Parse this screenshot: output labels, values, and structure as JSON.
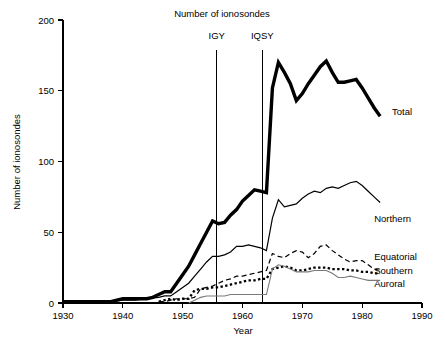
{
  "chart_data": {
    "type": "line",
    "title": "Number of ionosondes",
    "xlabel": "Year",
    "ylabel": "Number of ionosondes",
    "xlim": [
      1930,
      1990
    ],
    "ylim": [
      0,
      200
    ],
    "xticks": [
      1930,
      1940,
      1950,
      1960,
      1970,
      1980,
      1990
    ],
    "xtick_labels": [
      "1930",
      "1940",
      "1950",
      "1960",
      "1970",
      "1980",
      "1990"
    ],
    "yticks": [
      0,
      50,
      100,
      150,
      200
    ],
    "ytick_labels": [
      "0",
      "50",
      "100",
      "150",
      "200"
    ],
    "grid": false,
    "legend_position": "right-inline",
    "annotations": [
      {
        "label": "IGY",
        "x": 1955.7,
        "label_y": 185
      },
      {
        "label": "IQSY",
        "x": 1963.3,
        "label_y": 185
      }
    ],
    "series": [
      {
        "name": "Total",
        "style": "thick-solid",
        "color": "#000000",
        "label_x": 1984.5,
        "label_y": 135,
        "x": [
          1930,
          1932,
          1934,
          1936,
          1938,
          1939,
          1940,
          1941,
          1942,
          1943,
          1944,
          1945,
          1946,
          1947,
          1948,
          1949,
          1950,
          1951,
          1952,
          1953,
          1954,
          1955,
          1956,
          1957,
          1958,
          1959,
          1960,
          1961,
          1962,
          1963,
          1964,
          1965,
          1966,
          1967,
          1968,
          1969,
          1970,
          1971,
          1972,
          1973,
          1974,
          1975,
          1976,
          1977,
          1978,
          1979,
          1980,
          1981,
          1982,
          1983
        ],
        "values": [
          1,
          1,
          1,
          1,
          1,
          2,
          3,
          3,
          3,
          3,
          3,
          4,
          6,
          8,
          8,
          14,
          20,
          26,
          34,
          42,
          50,
          58,
          56,
          57,
          62,
          66,
          72,
          76,
          80,
          79,
          78,
          152,
          170,
          163,
          155,
          143,
          148,
          155,
          161,
          167,
          171,
          163,
          156,
          156,
          157,
          158,
          152,
          145,
          138,
          132
        ]
      },
      {
        "name": "Northern",
        "style": "thin-solid",
        "color": "#000000",
        "label_x": 1981.5,
        "label_y": 60,
        "x": [
          1930,
          1935,
          1938,
          1940,
          1942,
          1944,
          1946,
          1947,
          1948,
          1949,
          1950,
          1951,
          1952,
          1953,
          1954,
          1955,
          1956,
          1957,
          1958,
          1959,
          1960,
          1961,
          1962,
          1963,
          1964,
          1965,
          1966,
          1967,
          1968,
          1969,
          1970,
          1971,
          1972,
          1973,
          1974,
          1975,
          1976,
          1977,
          1978,
          1979,
          1980,
          1981,
          1982,
          1983
        ],
        "values": [
          1,
          1,
          1,
          2,
          2,
          3,
          4,
          5,
          5,
          8,
          11,
          14,
          19,
          24,
          29,
          33,
          33,
          34,
          36,
          40,
          40,
          41,
          40,
          39,
          37,
          60,
          73,
          68,
          69,
          70,
          74,
          77,
          79,
          78,
          81,
          82,
          81,
          83,
          85,
          86,
          83,
          79,
          75,
          71
        ]
      },
      {
        "name": "Equatorial",
        "style": "dashed",
        "color": "#000000",
        "label_x": 1981.5,
        "label_y": 33,
        "x": [
          1946,
          1947,
          1948,
          1949,
          1950,
          1951,
          1952,
          1953,
          1954,
          1955,
          1956,
          1957,
          1958,
          1959,
          1960,
          1961,
          1962,
          1963,
          1964,
          1965,
          1966,
          1967,
          1968,
          1969,
          1970,
          1971,
          1972,
          1973,
          1974,
          1975,
          1976,
          1977,
          1978,
          1979,
          1980,
          1981,
          1982,
          1983
        ],
        "values": [
          1,
          1,
          2,
          3,
          3,
          3,
          4,
          10,
          11,
          12,
          14,
          16,
          17,
          19,
          19,
          20,
          21,
          22,
          23,
          35,
          33,
          32,
          35,
          37,
          36,
          32,
          35,
          40,
          41,
          37,
          34,
          31,
          29,
          30,
          30,
          27,
          24,
          23
        ]
      },
      {
        "name": "Southern",
        "style": "thick-dotted",
        "color": "#000000",
        "label_x": 1981.5,
        "label_y": 23,
        "x": [
          1946,
          1947,
          1948,
          1949,
          1950,
          1951,
          1952,
          1953,
          1954,
          1955,
          1956,
          1957,
          1958,
          1959,
          1960,
          1961,
          1962,
          1963,
          1964,
          1965,
          1966,
          1967,
          1968,
          1969,
          1970,
          1971,
          1972,
          1973,
          1974,
          1975,
          1976,
          1977,
          1978,
          1979,
          1980,
          1981,
          1982,
          1983
        ],
        "values": [
          1,
          2,
          3,
          2,
          3,
          3,
          9,
          10,
          10,
          11,
          11,
          12,
          13,
          14,
          15,
          16,
          16,
          17,
          17,
          24,
          25,
          26,
          25,
          23,
          23,
          24,
          25,
          25,
          25,
          24,
          24,
          24,
          23,
          23,
          22,
          22,
          21,
          21
        ]
      },
      {
        "name": "Auroral",
        "style": "thin-solid-gray",
        "color": "#7a7a7a",
        "label_x": 1981.5,
        "label_y": 14,
        "x": [
          1951,
          1952,
          1953,
          1954,
          1955,
          1956,
          1957,
          1958,
          1959,
          1960,
          1961,
          1962,
          1963,
          1964,
          1965,
          1966,
          1967,
          1968,
          1969,
          1970,
          1971,
          1972,
          1973,
          1974,
          1975,
          1976,
          1977,
          1978,
          1979,
          1980,
          1981,
          1982,
          1983
        ],
        "values": [
          0,
          2,
          4,
          5,
          5,
          5,
          5,
          6,
          6,
          6,
          6,
          6,
          6,
          6,
          24,
          27,
          26,
          24,
          22,
          22,
          22,
          23,
          23,
          23,
          21,
          18,
          18,
          19,
          18,
          17,
          16,
          16,
          16
        ]
      }
    ]
  }
}
